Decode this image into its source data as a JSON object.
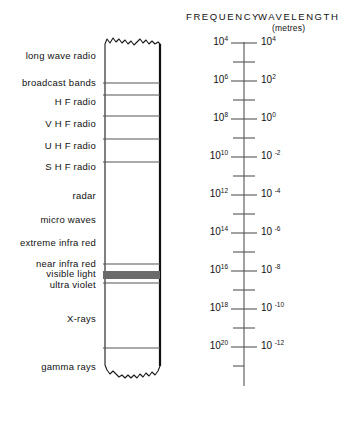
{
  "headers": {
    "frequency": "FREQUENCY",
    "wavelength": "WAVELENGTH",
    "units": "(metres)"
  },
  "bands": [
    {
      "label": "long wave radio",
      "y": 56
    },
    {
      "label": "broadcast bands",
      "y": 83
    },
    {
      "label": "H F radio",
      "y": 102
    },
    {
      "label": "V H F radio",
      "y": 124
    },
    {
      "label": "U H F radio",
      "y": 146
    },
    {
      "label": "S H F radio",
      "y": 167
    },
    {
      "label": "radar",
      "y": 196
    },
    {
      "label": "micro waves",
      "y": 220
    },
    {
      "label": "extreme infra red",
      "y": 243
    },
    {
      "label": "near infra red",
      "y": 264
    },
    {
      "label": "visible light",
      "y": 274
    },
    {
      "label": "ultra violet",
      "y": 285
    },
    {
      "label": "X-rays",
      "y": 319
    },
    {
      "label": "gamma rays",
      "y": 367
    }
  ],
  "dividers": [
    83,
    95,
    116,
    139,
    162,
    264,
    283,
    348
  ],
  "visible_light_band": {
    "top": 271,
    "bottom": 279
  },
  "chart_data": {
    "type": "table",
    "xlabel": "",
    "ylabel": "",
    "axes": [
      {
        "name": "FREQUENCY",
        "side": "left",
        "unit": "Hz",
        "labeled_decades": [
          4,
          6,
          8,
          10,
          12,
          14,
          16,
          18,
          20
        ],
        "direction": "increasing-downward"
      },
      {
        "name": "WAVELENGTH",
        "side": "right",
        "unit": "metres",
        "labeled_decades": [
          4,
          2,
          0,
          -2,
          -4,
          -6,
          -8,
          -10,
          -12
        ],
        "direction": "decreasing-downward"
      }
    ],
    "categories": [
      "long wave radio",
      "broadcast bands",
      "H F radio",
      "V H F radio",
      "U H F radio",
      "S H F radio",
      "radar",
      "micro waves",
      "extreme infra red",
      "near infra red",
      "visible light",
      "ultra violet",
      "X-rays",
      "gamma rays"
    ]
  },
  "frequency_ticks": [
    {
      "mantissa": "10",
      "exponent": "4",
      "y": 43
    },
    {
      "mantissa": "10",
      "exponent": "6",
      "y": 81
    },
    {
      "mantissa": "10",
      "exponent": "8",
      "y": 119
    },
    {
      "mantissa": "10",
      "exponent": "10",
      "y": 157
    },
    {
      "mantissa": "10",
      "exponent": "12",
      "y": 195
    },
    {
      "mantissa": "10",
      "exponent": "14",
      "y": 233
    },
    {
      "mantissa": "10",
      "exponent": "16",
      "y": 271
    },
    {
      "mantissa": "10",
      "exponent": "18",
      "y": 309
    },
    {
      "mantissa": "10",
      "exponent": "20",
      "y": 347
    }
  ],
  "wavelength_ticks": [
    {
      "mantissa": "10",
      "exponent": "4",
      "y": 43
    },
    {
      "mantissa": "10",
      "exponent": "2",
      "y": 81
    },
    {
      "mantissa": "10",
      "exponent": "0",
      "y": 119
    },
    {
      "mantissa": "10",
      "exponent": "-2",
      "y": 157
    },
    {
      "mantissa": "10",
      "exponent": "-4",
      "y": 195
    },
    {
      "mantissa": "10",
      "exponent": "-6",
      "y": 233
    },
    {
      "mantissa": "10",
      "exponent": "-8",
      "y": 271
    },
    {
      "mantissa": "10",
      "exponent": "-10",
      "y": 309
    },
    {
      "mantissa": "10",
      "exponent": "-12",
      "y": 347
    }
  ],
  "colors": {
    "ink": "#1a1a1a",
    "line": "#555555",
    "border": "#111111",
    "visible_band": "#6b6b6b",
    "background": "#ffffff"
  }
}
